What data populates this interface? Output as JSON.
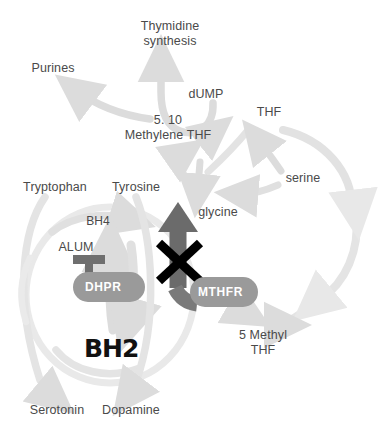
{
  "diagram": {
    "colors": {
      "arrow_light": "#dcdcdc",
      "arrow_pale": "#e6e6e6",
      "arrow_dark": "#6b6b6b",
      "enzyme_fill": "#9a9a9a",
      "enzyme_text": "#ffffff",
      "label_text": "#4a4a4a",
      "block_symbol": "#000000",
      "background": "#ffffff"
    },
    "metabolites": [
      {
        "id": "thymidine",
        "label": "Thymidine\nsynthesis",
        "line1": "Thymidine",
        "line2": "synthesis",
        "x": 170,
        "y": 26
      },
      {
        "id": "purines",
        "label": "Purines",
        "line1": "Purines",
        "line2": "",
        "x": 50,
        "y": 68
      },
      {
        "id": "dump",
        "label": "dUMP",
        "line1": "dUMP",
        "line2": "",
        "x": 206,
        "y": 94
      },
      {
        "id": "thf",
        "label": "THF",
        "line1": "THF",
        "line2": "",
        "x": 269,
        "y": 112
      },
      {
        "id": "methylene",
        "label": "5. 10\nMethylene THF",
        "line1": "5. 10",
        "line2": "Methylene THF",
        "x": 168,
        "y": 127
      },
      {
        "id": "serine",
        "label": "serine",
        "line1": "serine",
        "line2": "",
        "x": 303,
        "y": 178
      },
      {
        "id": "tryptophan",
        "label": "Tryptophan",
        "line1": "Tryptophan",
        "line2": "",
        "x": 55,
        "y": 187
      },
      {
        "id": "tyrosine",
        "label": "Tyrosine",
        "line1": "Tyrosine",
        "line2": "",
        "x": 136,
        "y": 187
      },
      {
        "id": "glycine",
        "label": "glycine",
        "line1": "glycine",
        "line2": "",
        "x": 217,
        "y": 212
      },
      {
        "id": "bh4",
        "label": "BH4",
        "line1": "BH4",
        "line2": "",
        "x": 97,
        "y": 221
      },
      {
        "id": "alum",
        "label": "ALUM",
        "line1": "ALUM",
        "line2": "",
        "x": 75,
        "y": 247
      },
      {
        "id": "5methylthf",
        "label": "5 Methyl\nTHF",
        "line1": "5 Methyl",
        "line2": "THF",
        "x": 263,
        "y": 341
      },
      {
        "id": "bh2",
        "label": "BH2",
        "line1": "BH2",
        "line2": "",
        "x": 107,
        "y": 350
      },
      {
        "id": "serotonin",
        "label": "Serotonin",
        "line1": "Serotonin",
        "line2": "",
        "x": 56,
        "y": 410
      },
      {
        "id": "dopamine",
        "label": "Dopamine",
        "line1": "Dopamine",
        "line2": "",
        "x": 130,
        "y": 410
      }
    ],
    "enzymes": [
      {
        "id": "dhpr",
        "label": "DHPR",
        "x": 73,
        "y": 272,
        "w": 72,
        "h": 30
      },
      {
        "id": "mthfr",
        "label": "MTHFR",
        "x": 190,
        "y": 277,
        "w": 68,
        "h": 30
      }
    ],
    "annotations": [
      {
        "id": "alum-inhibition",
        "type": "inhibition-bar",
        "target": "dhpr"
      },
      {
        "id": "mthfr-block",
        "type": "blocked-x",
        "target": "methylation-arrow"
      }
    ],
    "flow_arrow": {
      "id": "methylation-arrow",
      "from": "5 Methyl THF / MTHFR",
      "to": "5. 10 Methylene THF",
      "blocked": true
    }
  }
}
